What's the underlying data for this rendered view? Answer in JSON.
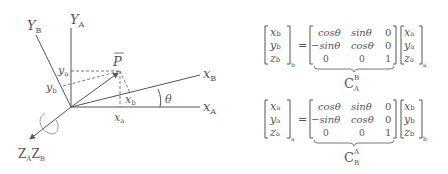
{
  "diagram": {
    "axes": {
      "YA": {
        "main": "Y",
        "sub": "A"
      },
      "YB": {
        "main": "Y",
        "sub": "B"
      },
      "XA": {
        "main": "x",
        "sub": "A"
      },
      "XB": {
        "main": "x",
        "sub": "B"
      },
      "Z": {
        "main1": "Z",
        "sub1": "A",
        "main2": "Z",
        "sub2": "B"
      }
    },
    "point": "P",
    "ya": {
      "main": "y",
      "sub": "a"
    },
    "yb": {
      "main": "y",
      "sub": "b"
    },
    "xa": {
      "main": "x",
      "sub": "a"
    },
    "xb": {
      "main": "x",
      "sub": "b"
    },
    "angle": "θ"
  },
  "eq1": {
    "lhs": [
      [
        "x",
        "b"
      ],
      [
        "y",
        "b"
      ],
      [
        "z",
        "b"
      ]
    ],
    "lhs_sub": "b",
    "m": [
      [
        "cosθ",
        "sinθ",
        "0"
      ],
      [
        "−sinθ",
        "cosθ",
        "0"
      ],
      [
        "0",
        "0",
        "1"
      ]
    ],
    "rhs": [
      [
        "x",
        "a"
      ],
      [
        "y",
        "a"
      ],
      [
        "z",
        "a"
      ]
    ],
    "rhs_sub": "a",
    "label": {
      "main": "C",
      "sup": "B",
      "sub": "A"
    }
  },
  "eq2": {
    "lhs": [
      [
        "x",
        "a"
      ],
      [
        "y",
        "a"
      ],
      [
        "z",
        "a"
      ]
    ],
    "lhs_sub": "a",
    "m": [
      [
        "cosθ",
        "sinθ",
        "0"
      ],
      [
        "−sinθ",
        "cosθ",
        "0"
      ],
      [
        "0",
        "0",
        "1"
      ]
    ],
    "rhs": [
      [
        "x",
        "b"
      ],
      [
        "y",
        "b"
      ],
      [
        "z",
        "b"
      ]
    ],
    "rhs_sub": "b",
    "label": {
      "main": "C",
      "sup": "A",
      "sub": "B"
    }
  },
  "eq_sign": "="
}
